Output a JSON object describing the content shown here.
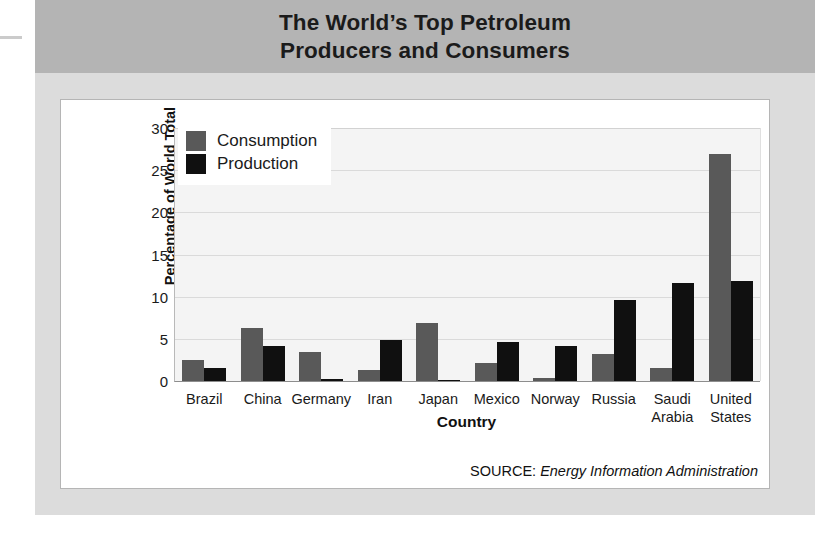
{
  "title": "The World’s Top Petroleum\nProducers and Consumers",
  "title_line1": "The World’s Top Petroleum",
  "title_line2": "Producers and Consumers",
  "source": {
    "label": "SOURCE:",
    "text": "Energy Information Administration"
  },
  "colors": {
    "consumption": "#595959",
    "production": "#101010",
    "title_band": "#b4b4b4",
    "page_panel": "#dcdcdc",
    "plot_background": "#f4f4f4",
    "gridline": "#dadada",
    "card_border": "#b5b5b5"
  },
  "chart_data": {
    "type": "bar",
    "title": "The World’s Top Petroleum Producers and Consumers",
    "xlabel": "Country",
    "ylabel": "Percentage of World Total",
    "ylim": [
      0,
      30
    ],
    "yticks": [
      0,
      5,
      10,
      15,
      20,
      25,
      30
    ],
    "ytick_labels": [
      "0",
      "5",
      "10",
      "15",
      "20",
      "25",
      "30"
    ],
    "grid": true,
    "grid_axis": "y",
    "legend_position": "upper left",
    "categories": [
      "Brazil",
      "China",
      "Germany",
      "Iran",
      "Japan",
      "Mexico",
      "Norway",
      "Russia",
      "Saudi Arabia",
      "United States"
    ],
    "category_labels": [
      "Brazil",
      "China",
      "Germany",
      "Iran",
      "Japan",
      "Mexico",
      "Norway",
      "Russia",
      "Saudi\nArabia",
      "United\nStates"
    ],
    "series": [
      {
        "name": "Consumption",
        "color": "#595959",
        "values": [
          2.5,
          6.3,
          3.4,
          1.3,
          6.9,
          2.1,
          0.3,
          3.2,
          1.6,
          26.9
        ]
      },
      {
        "name": "Production",
        "color": "#101010",
        "values": [
          1.6,
          4.1,
          0.2,
          4.9,
          0.1,
          4.6,
          4.2,
          9.6,
          11.6,
          11.9
        ]
      }
    ],
    "annotations": [
      "SOURCE: Energy Information Administration"
    ]
  }
}
